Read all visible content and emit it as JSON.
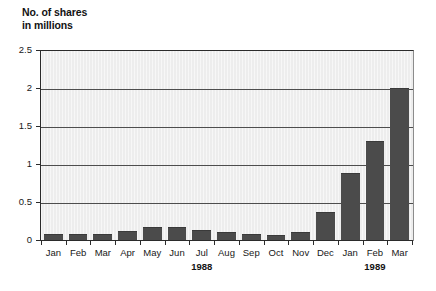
{
  "chart_data": {
    "type": "bar",
    "title_line1": "No. of shares",
    "title_line2": "in millions",
    "xlabel": "",
    "ylabel": "No. of shares in millions",
    "ylim": [
      0,
      2.5
    ],
    "ytick_labels": [
      "0",
      "0.5",
      "1",
      "1.5",
      "2",
      "2.5"
    ],
    "ytick_values": [
      0,
      0.5,
      1,
      1.5,
      2,
      2.5
    ],
    "grid": "horizontal",
    "legend": "none",
    "bar_color": "#4b4b4b",
    "plot_background": "#ededed",
    "categories": [
      "Jan",
      "Feb",
      "Mar",
      "Apr",
      "May",
      "Jun",
      "Jul",
      "Aug",
      "Sep",
      "Oct",
      "Nov",
      "Dec",
      "Jan",
      "Feb",
      "Mar"
    ],
    "values": [
      0.08,
      0.08,
      0.08,
      0.12,
      0.17,
      0.17,
      0.13,
      0.1,
      0.08,
      0.06,
      0.1,
      0.37,
      0.88,
      1.3,
      2.0
    ],
    "group_labels": [
      {
        "text": "1988",
        "center_category_index": 6
      },
      {
        "text": "1989",
        "center_category_index": 13
      }
    ],
    "annotations": []
  }
}
